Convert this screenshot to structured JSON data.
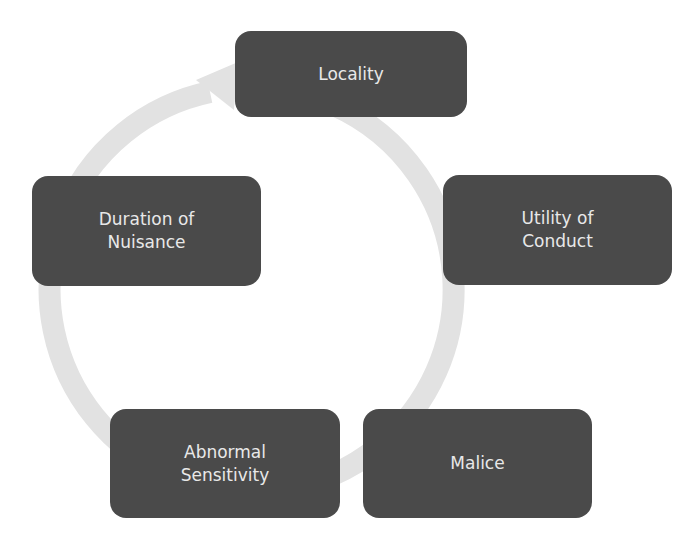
{
  "diagram": {
    "type": "cycle",
    "ring_color": "#e2e2e2",
    "box_color": "#4a4a4a",
    "text_color": "#e8e8e8",
    "nodes": [
      {
        "label": "Locality"
      },
      {
        "label": "Utility of Conduct"
      },
      {
        "label": "Malice"
      },
      {
        "label": "Abnormal Sensitivity"
      },
      {
        "label": "Duration of Nuisance"
      }
    ]
  }
}
